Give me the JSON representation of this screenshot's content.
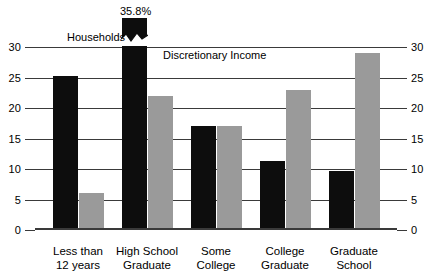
{
  "chart_data": {
    "type": "bar",
    "title": "",
    "xlabel": "",
    "ylabel": "",
    "ylim": [
      0,
      30
    ],
    "grid": true,
    "legend_position": "inline-annotation",
    "categories": [
      "Less than\n12 years",
      "High School\nGraduate",
      "Some\nCollege",
      "College\nGraduate",
      "Graduate\nSchool"
    ],
    "yticks": [
      "30",
      "25",
      "20",
      "15",
      "10",
      "5",
      "0"
    ],
    "ytick_values": [
      30,
      25,
      20,
      15,
      10,
      5,
      0
    ],
    "series": [
      {
        "name": "Households",
        "color": "#0d0d0d",
        "values": [
          25.3,
          35.8,
          17.0,
          11.3,
          9.7
        ],
        "broken_bar_index": 1,
        "broken_bar_label": "35.8%"
      },
      {
        "name": "Discretionary Income",
        "color": "#9a9a9a",
        "values": [
          6.0,
          22.0,
          17.0,
          23.0,
          29.0
        ]
      }
    ],
    "annotations": [
      {
        "text": "35.8%",
        "target": "high-school-graduate-households"
      },
      {
        "text": "Households",
        "target": "dark-series"
      },
      {
        "text": "Discretionary\nIncome",
        "target": "light-series"
      }
    ]
  },
  "legend": {
    "households_label": "Households",
    "discretionary_label": "Discretionary\nIncome"
  },
  "axis": {
    "left_ticks": [
      "30",
      "25",
      "20",
      "15",
      "10",
      "5",
      "0"
    ],
    "right_ticks": [
      "30",
      "25",
      "20",
      "15",
      "10",
      "5",
      "0"
    ]
  }
}
